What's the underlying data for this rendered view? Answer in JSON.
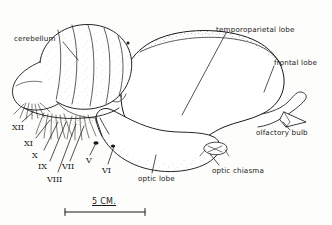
{
  "figure": {
    "type": "anatomical-line-drawing",
    "background_color": "#fdfdfb",
    "ink_color": "#1a1a1a"
  },
  "labels": {
    "cerebellum": "cerebellum",
    "temporoparietal_lobe": "temporoparietal lobe",
    "frontal_lobe": "frontal lobe",
    "olfactory_bulb": "olfactory bulb",
    "optic_chiasma": "optic chiasma",
    "optic_lobe": "optic lobe"
  },
  "cranial_nerves": [
    {
      "numeral": "XII",
      "x": 12,
      "y": 124
    },
    {
      "numeral": "XI",
      "x": 24,
      "y": 140
    },
    {
      "numeral": "X",
      "x": 32,
      "y": 152
    },
    {
      "numeral": "IX",
      "x": 38,
      "y": 163
    },
    {
      "numeral": "VIII",
      "x": 47,
      "y": 176
    },
    {
      "numeral": "VII",
      "x": 62,
      "y": 163
    },
    {
      "numeral": "V",
      "x": 86,
      "y": 157
    },
    {
      "numeral": "VI",
      "x": 102,
      "y": 167
    }
  ],
  "scale_bar": {
    "text": "5 CM.",
    "units": "CM.",
    "value": 5,
    "bar_x_start": 65,
    "bar_x_end": 145,
    "bar_y": 212
  }
}
